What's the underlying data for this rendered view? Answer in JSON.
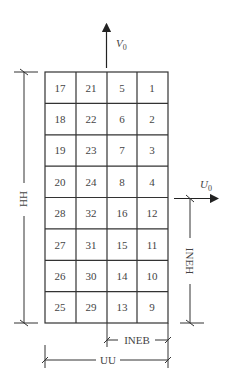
{
  "diagram": {
    "grid": {
      "rows": 8,
      "cols": 4,
      "cells": [
        [
          "17",
          "21",
          "5",
          "1"
        ],
        [
          "18",
          "22",
          "6",
          "2"
        ],
        [
          "19",
          "23",
          "7",
          "3"
        ],
        [
          "20",
          "24",
          "8",
          "4"
        ],
        [
          "28",
          "32",
          "16",
          "12"
        ],
        [
          "27",
          "31",
          "15",
          "11"
        ],
        [
          "26",
          "30",
          "14",
          "10"
        ],
        [
          "25",
          "29",
          "13",
          "9"
        ]
      ]
    },
    "arrows": {
      "v0": {
        "label": "V",
        "subscript": "0"
      },
      "u0": {
        "label": "U",
        "subscript": "0"
      }
    },
    "dimensions": {
      "height_total": "HH",
      "width_total": "UU",
      "inner_height": "INEH",
      "inner_width": "INEB"
    },
    "colors": {
      "line": "#333333",
      "text": "#444444",
      "background": "#ffffff"
    }
  }
}
